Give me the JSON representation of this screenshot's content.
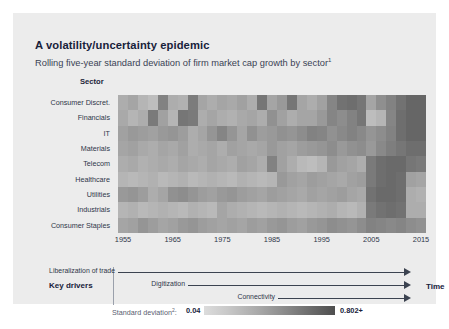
{
  "title": "A volatility/uncertainty epidemic",
  "subtitle": "Rolling five-year standard deviation of firm market cap growth by sector",
  "subtitle_footnote": "1",
  "sector_header": "Sector",
  "key_drivers": {
    "label": "Key drivers",
    "time_label": "Time",
    "items": [
      {
        "label": "Liberalization of trade"
      },
      {
        "label": "Digitization"
      },
      {
        "label": "Connectivity"
      }
    ]
  },
  "legend": {
    "caption": "Standard deviation",
    "caption_footnote": "2",
    "caption_suffix": ":",
    "min": "0.04",
    "max": "0.802+",
    "color_low": "#dcdcdc",
    "color_high": "#4e4e4e"
  },
  "chart_data": {
    "type": "heatmap",
    "title": "A volatility/uncertainty epidemic",
    "subtitle": "Rolling five-year standard deviation of firm market cap growth by sector",
    "xlabel": "",
    "ylabel": "Sector",
    "legend_position": "bottom",
    "grid": false,
    "colorbar": {
      "label": "Standard deviation",
      "min": 0.04,
      "max": 0.802,
      "scheme": "grayscale-light-to-dark"
    },
    "x_tick_labels": [
      "1955",
      "1965",
      "1975",
      "1985",
      "1995",
      "2005",
      "2015"
    ],
    "x_start_year": 1955,
    "x_end_year": 2017,
    "x_columns": 31,
    "y_categories": [
      "Consumer Discret.",
      "Financials",
      "IT",
      "Materials",
      "Telecom",
      "Healthcare",
      "Utilities",
      "Industrials",
      "Consumer Staples"
    ],
    "values": [
      [
        0.3,
        0.34,
        0.26,
        0.22,
        0.52,
        0.3,
        0.28,
        0.55,
        0.34,
        0.3,
        0.34,
        0.32,
        0.36,
        0.3,
        0.58,
        0.34,
        0.4,
        0.58,
        0.34,
        0.3,
        0.36,
        0.5,
        0.6,
        0.62,
        0.58,
        0.34,
        0.45,
        0.52,
        0.6,
        0.66,
        0.66
      ],
      [
        0.32,
        0.26,
        0.3,
        0.56,
        0.36,
        0.26,
        0.58,
        0.56,
        0.3,
        0.34,
        0.3,
        0.28,
        0.32,
        0.34,
        0.3,
        0.44,
        0.36,
        0.3,
        0.34,
        0.34,
        0.4,
        0.5,
        0.46,
        0.52,
        0.58,
        0.22,
        0.26,
        0.5,
        0.62,
        0.66,
        0.66
      ],
      [
        0.36,
        0.4,
        0.38,
        0.36,
        0.4,
        0.42,
        0.38,
        0.3,
        0.34,
        0.42,
        0.5,
        0.42,
        0.34,
        0.44,
        0.38,
        0.4,
        0.44,
        0.42,
        0.46,
        0.52,
        0.5,
        0.44,
        0.48,
        0.52,
        0.48,
        0.42,
        0.46,
        0.52,
        0.62,
        0.66,
        0.66
      ],
      [
        0.34,
        0.36,
        0.32,
        0.3,
        0.34,
        0.32,
        0.36,
        0.3,
        0.32,
        0.34,
        0.3,
        0.36,
        0.34,
        0.32,
        0.34,
        0.4,
        0.36,
        0.34,
        0.38,
        0.4,
        0.42,
        0.46,
        0.4,
        0.44,
        0.46,
        0.4,
        0.48,
        0.54,
        0.58,
        0.62,
        0.62
      ],
      [
        0.3,
        0.32,
        0.28,
        0.3,
        0.32,
        0.3,
        0.34,
        0.32,
        0.3,
        0.34,
        0.32,
        0.3,
        0.36,
        0.34,
        0.3,
        0.52,
        0.36,
        0.3,
        0.24,
        0.22,
        0.26,
        0.4,
        0.36,
        0.34,
        0.3,
        0.56,
        0.62,
        0.64,
        0.64,
        0.58,
        0.56
      ],
      [
        0.26,
        0.24,
        0.26,
        0.28,
        0.24,
        0.26,
        0.28,
        0.24,
        0.26,
        0.28,
        0.26,
        0.24,
        0.28,
        0.26,
        0.24,
        0.26,
        0.4,
        0.36,
        0.34,
        0.38,
        0.36,
        0.34,
        0.32,
        0.36,
        0.38,
        0.56,
        0.62,
        0.64,
        0.62,
        0.36,
        0.34
      ],
      [
        0.4,
        0.42,
        0.38,
        0.3,
        0.34,
        0.44,
        0.46,
        0.42,
        0.38,
        0.36,
        0.4,
        0.42,
        0.38,
        0.36,
        0.34,
        0.38,
        0.36,
        0.34,
        0.32,
        0.36,
        0.34,
        0.36,
        0.38,
        0.34,
        0.32,
        0.6,
        0.64,
        0.64,
        0.62,
        0.3,
        0.28
      ],
      [
        0.26,
        0.28,
        0.24,
        0.26,
        0.28,
        0.26,
        0.24,
        0.28,
        0.26,
        0.24,
        0.34,
        0.3,
        0.28,
        0.26,
        0.24,
        0.26,
        0.28,
        0.26,
        0.24,
        0.26,
        0.28,
        0.3,
        0.26,
        0.24,
        0.28,
        0.56,
        0.6,
        0.62,
        0.6,
        0.3,
        0.3
      ],
      [
        0.34,
        0.36,
        0.42,
        0.38,
        0.34,
        0.36,
        0.4,
        0.42,
        0.38,
        0.36,
        0.34,
        0.36,
        0.34,
        0.38,
        0.36,
        0.4,
        0.42,
        0.38,
        0.36,
        0.4,
        0.42,
        0.46,
        0.44,
        0.42,
        0.46,
        0.52,
        0.5,
        0.48,
        0.5,
        0.46,
        0.44
      ]
    ]
  }
}
